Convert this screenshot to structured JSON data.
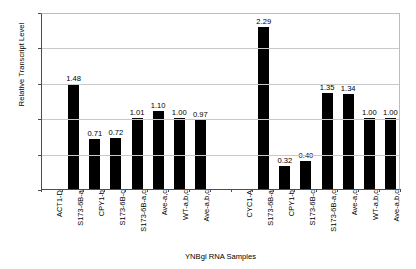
{
  "chart_data": {
    "type": "bar",
    "title": "",
    "xlabel": "YNBgl RNA Samples",
    "ylabel": "Relative Transcript Level",
    "ylim": [
      0.0,
      2.5
    ],
    "yticks": [
      "0.00",
      "0.50",
      "1.00",
      "1.50",
      "2.00",
      "2.50"
    ],
    "ytick_values": [
      0.0,
      0.5,
      1.0,
      1.5,
      2.0,
      2.5
    ],
    "grid": true,
    "legend": "none",
    "bar_color": "#000000",
    "categories": [
      "ACT1-D",
      "S173-6B-a",
      "CPY1-b",
      "S173-6B-c",
      "S173-6B-a,c",
      "Ave-a,c",
      "WT-a,b,c",
      "Ave-a,b,c",
      "",
      "CYC1-A",
      "S173-6B-a",
      "CPY1-b",
      "S173-6B-c",
      "S173-6B-a,c",
      "Ave-a,c",
      "WT-a,b,c",
      "Ave-a,b,c"
    ],
    "values": [
      null,
      1.48,
      0.71,
      0.72,
      1.01,
      1.1,
      1.0,
      0.97,
      null,
      null,
      2.29,
      0.32,
      0.4,
      1.35,
      1.34,
      1.0,
      1.0
    ],
    "value_labels": [
      "",
      "1.48",
      "0.71",
      "0.72",
      "1.01",
      "1.10",
      "1.00",
      "0.97",
      "",
      "",
      "2.29",
      "0.32",
      "0.40",
      "1.35",
      "1.34",
      "1.00",
      "1.00"
    ]
  }
}
